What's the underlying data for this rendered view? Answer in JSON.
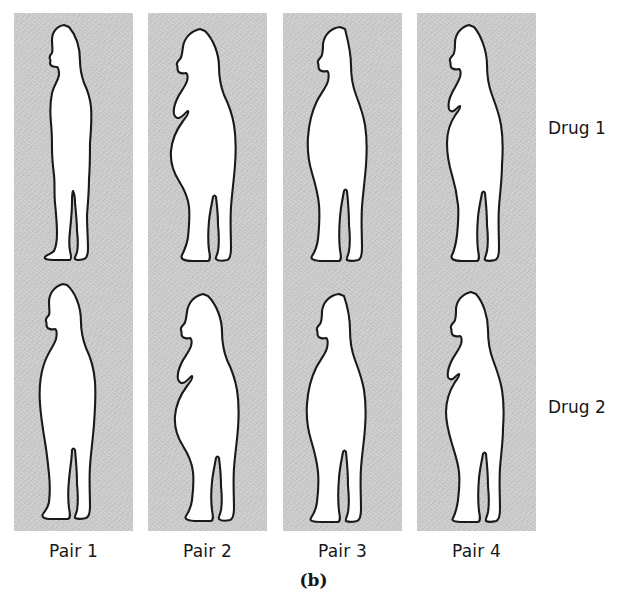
{
  "figure": {
    "caption": "(b)",
    "background_color": "#c9c9c9",
    "page_color": "#ffffff",
    "outline_color": "#1a1a1a",
    "body_fill": "#ffffff",
    "row_labels": [
      {
        "id": "drug-1",
        "label": "Drug 1"
      },
      {
        "id": "drug-2",
        "label": "Drug 2"
      }
    ],
    "column_labels": [
      {
        "id": "pair-1",
        "label": "Pair 1"
      },
      {
        "id": "pair-2",
        "label": "Pair 2"
      },
      {
        "id": "pair-3",
        "label": "Pair 3"
      },
      {
        "id": "pair-4",
        "label": "Pair 4"
      }
    ],
    "figures": [
      {
        "pair": "Pair 1",
        "row": "Drug 1",
        "icon": "human-silhouette-slim-male-icon",
        "build": "slim",
        "sex": "male"
      },
      {
        "pair": "Pair 2",
        "row": "Drug 1",
        "icon": "human-silhouette-heavy-female-icon",
        "build": "heavy",
        "sex": "female"
      },
      {
        "pair": "Pair 3",
        "row": "Drug 1",
        "icon": "human-silhouette-heavy-male-icon",
        "build": "heavy",
        "sex": "male"
      },
      {
        "pair": "Pair 4",
        "row": "Drug 1",
        "icon": "human-silhouette-slim-female-icon",
        "build": "slim",
        "sex": "female"
      },
      {
        "pair": "Pair 1",
        "row": "Drug 2",
        "icon": "human-silhouette-medium-male-icon",
        "build": "medium",
        "sex": "male"
      },
      {
        "pair": "Pair 2",
        "row": "Drug 2",
        "icon": "human-silhouette-heavy-female-icon",
        "build": "heavy",
        "sex": "female"
      },
      {
        "pair": "Pair 3",
        "row": "Drug 2",
        "icon": "human-silhouette-heavy-male-icon",
        "build": "heavy",
        "sex": "male"
      },
      {
        "pair": "Pair 4",
        "row": "Drug 2",
        "icon": "human-silhouette-medium-female-icon",
        "build": "medium",
        "sex": "female"
      }
    ]
  }
}
